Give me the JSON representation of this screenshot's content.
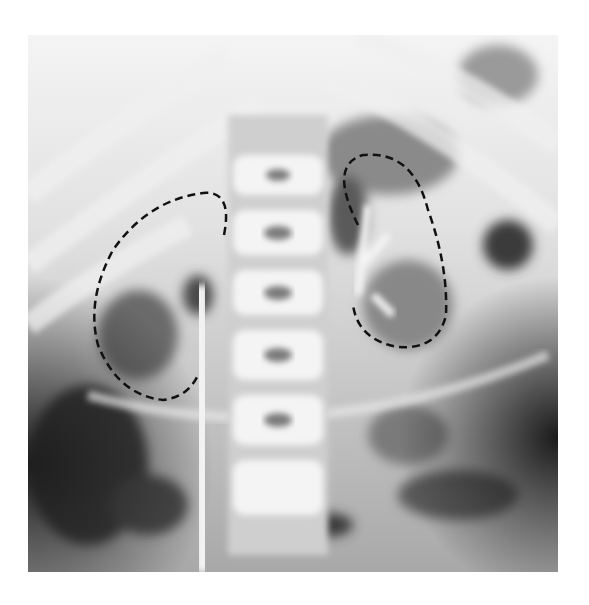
{
  "image": {
    "description": "Frontal abdominal radiograph (X-ray) with two dashed outlines marking the kidneys on either side of the lumbar spine",
    "modality": "X-ray",
    "annotations": [
      {
        "name": "right-kidney-outline",
        "style": "dashed",
        "color": "#111111"
      },
      {
        "name": "left-kidney-outline",
        "style": "dashed",
        "color": "#111111"
      }
    ],
    "colors": {
      "background": "#ffffff",
      "bone": "#f2f2f2",
      "soft_tissue": "#9a9a9a",
      "gas_dark": "#2a2a2a"
    }
  }
}
